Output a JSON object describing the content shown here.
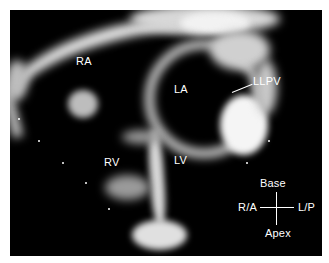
{
  "image": {
    "kind": "echocardiogram",
    "view": "apical four-chamber (inverted)",
    "background_color": "#000000",
    "margin_color": "#ffffff"
  },
  "labels": {
    "ra": "RA",
    "la": "LA",
    "llpv": "LLPV",
    "rv": "RV",
    "lv": "LV"
  },
  "orientation": {
    "top": "Base",
    "left": "R/A",
    "right": "L/P",
    "bottom": "Apex"
  }
}
